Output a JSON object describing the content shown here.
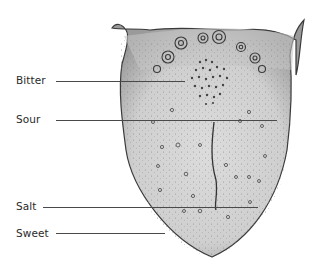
{
  "figure": {
    "labels": [
      {
        "id": "bitter",
        "text": "Bitter",
        "x": 16,
        "y": 74,
        "line": {
          "x1": 56,
          "x2": 185,
          "y": 81
        }
      },
      {
        "id": "sour",
        "text": "Sour",
        "x": 16,
        "y": 113,
        "line": {
          "x1": 56,
          "x2": 277,
          "y": 120
        }
      },
      {
        "id": "salt",
        "text": "Salt",
        "x": 16,
        "y": 200,
        "line": {
          "x1": 43,
          "x2": 258,
          "y": 207
        }
      },
      {
        "id": "sweet",
        "text": "Sweet",
        "x": 16,
        "y": 227,
        "line": {
          "x1": 56,
          "x2": 165,
          "y": 233
        }
      }
    ],
    "colors": {
      "background": "#ffffff",
      "tongue_fill": "#d9d9d9",
      "tongue_outline": "#3a3a3a",
      "papillae": "#555555",
      "label_text": "#2a2a2a",
      "leader_line": "#4a4a4a"
    }
  }
}
